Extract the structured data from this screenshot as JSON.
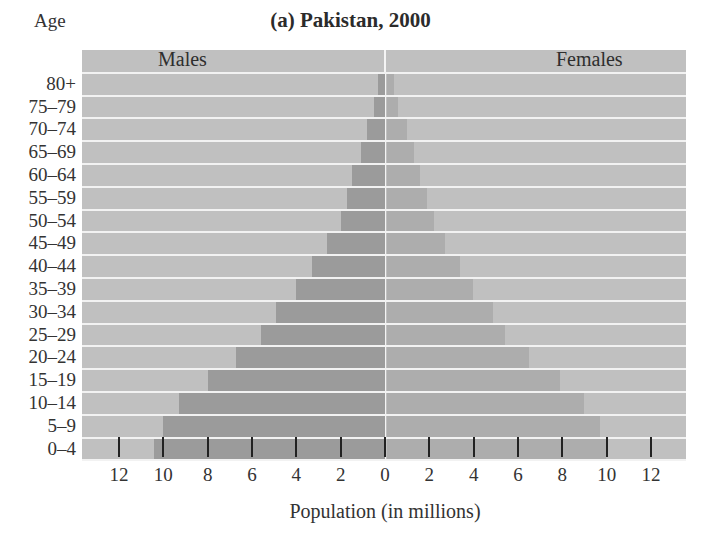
{
  "chart_data": {
    "type": "bar",
    "subtype": "population-pyramid",
    "title": "(a) Pakistan, 2000",
    "ylabel": "Age",
    "xlabel": "Population (in millions)",
    "categories": [
      "0–4",
      "5–9",
      "10–14",
      "15–19",
      "20–24",
      "25–29",
      "30–34",
      "35–39",
      "40–44",
      "45–49",
      "50–54",
      "55–59",
      "60–64",
      "65–69",
      "70–74",
      "75–79",
      "80+"
    ],
    "series": [
      {
        "name": "Males",
        "side": "left",
        "values": [
          10.4,
          10.0,
          9.3,
          8.0,
          6.7,
          5.6,
          4.9,
          4.0,
          3.3,
          2.6,
          2.0,
          1.7,
          1.5,
          1.1,
          0.8,
          0.5,
          0.3
        ]
      },
      {
        "name": "Females",
        "side": "right",
        "values": [
          9.9,
          9.6,
          8.9,
          7.8,
          6.4,
          5.3,
          4.8,
          3.9,
          3.3,
          2.6,
          2.1,
          1.8,
          1.5,
          1.2,
          0.9,
          0.5,
          0.3
        ]
      }
    ],
    "xticks_left": [
      "12",
      "10",
      "8",
      "6",
      "4",
      "2",
      "0"
    ],
    "xticks_right": [
      "2",
      "4",
      "6",
      "8",
      "10",
      "12"
    ],
    "xlim": [
      -13.7,
      13.6
    ],
    "grid": false,
    "legend_position": "inline labels (Males top-left, Females top-right)"
  },
  "labels": {
    "title": "(a) Pakistan, 2000",
    "age_header": "Age",
    "males": "Males",
    "females": "Females",
    "xlabel": "Population (in millions)"
  },
  "colors": {
    "background": "#c0c0c0",
    "males": "#9b9b9b",
    "females": "#adadad",
    "separator": "#f2f2f2"
  }
}
